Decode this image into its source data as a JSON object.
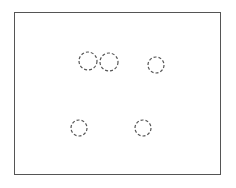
{
  "diagram": {
    "frame": {
      "x": 14,
      "y": 12,
      "width": 207,
      "height": 163,
      "stroke": "#555555"
    },
    "circles": [
      {
        "cx": 88,
        "cy": 61,
        "r": 9
      },
      {
        "cx": 109,
        "cy": 62,
        "r": 9
      },
      {
        "cx": 156,
        "cy": 65,
        "r": 8
      },
      {
        "cx": 79,
        "cy": 128,
        "r": 8
      },
      {
        "cx": 143,
        "cy": 128,
        "r": 8
      }
    ],
    "circle_stroke": "#555555",
    "circle_dash": "3,2"
  }
}
